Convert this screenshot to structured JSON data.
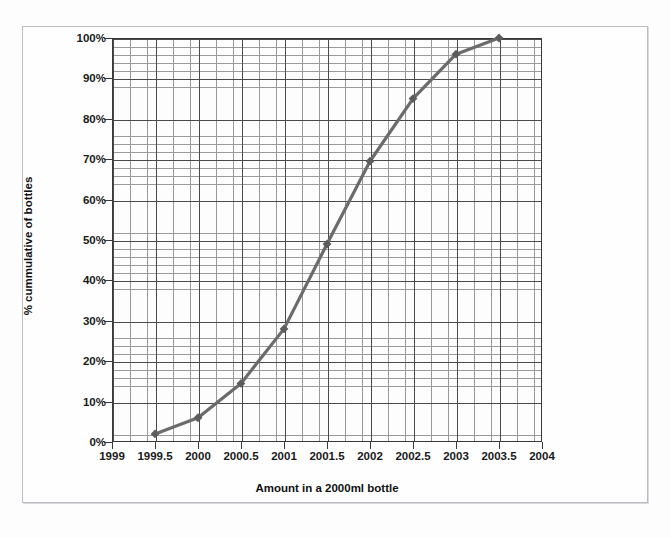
{
  "chart_data": {
    "type": "line",
    "title": "",
    "xlabel": "Amount in a 2000ml bottle",
    "ylabel": "% cummulative of bottles",
    "xlim": [
      1999,
      2004
    ],
    "ylim": [
      0,
      100
    ],
    "grid": true,
    "legend": "none",
    "marker": "diamond",
    "line_color": "#6b6b6b",
    "marker_color": "#5c5c5c",
    "grid_major_color": "#4a4a4a",
    "grid_minor_color": "#9a9a9a",
    "axis_color": "#3a3a3a",
    "x_tick_labels": [
      "1999",
      "1999.5",
      "2000",
      "2000.5",
      "2001",
      "2001.5",
      "2002",
      "2002.5",
      "2003",
      "2003.5",
      "2004"
    ],
    "x_tick_values": [
      1999,
      1999.5,
      2000,
      2000.5,
      2001,
      2001.5,
      2002,
      2002.5,
      2003,
      2003.5,
      2004
    ],
    "y_tick_labels": [
      "0%",
      "10%",
      "20%",
      "30%",
      "40%",
      "50%",
      "60%",
      "70%",
      "80%",
      "90%",
      "100%"
    ],
    "y_tick_values": [
      0,
      10,
      20,
      30,
      40,
      50,
      60,
      70,
      80,
      90,
      100
    ],
    "series": [
      {
        "name": "% cummulative of bottles",
        "x": [
          1999.5,
          2000,
          2000.5,
          2001,
          2001.5,
          2002,
          2002.5,
          2003,
          2003.5
        ],
        "values": [
          2,
          6,
          14.5,
          28,
          49,
          69.5,
          85,
          96,
          100
        ]
      }
    ]
  }
}
